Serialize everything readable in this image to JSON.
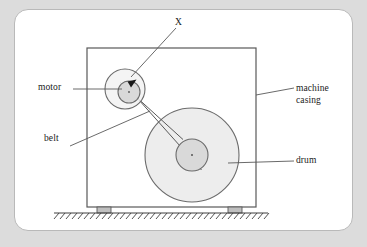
{
  "figure": {
    "labels": {
      "motor": "motor",
      "belt": "belt",
      "point_x": "X",
      "machine_casing_line1": "machine",
      "machine_casing_line2": "casing",
      "drum": "drum"
    },
    "colors": {
      "page_background": "#dcdcdc",
      "panel_background": "#ffffff",
      "panel_border": "#b9b9b9",
      "line": "#595959",
      "part_fill": "#ececec",
      "hub_fill": "#d9d9d9",
      "foot_fill": "#bfbfbf",
      "text": "#1a1a1a"
    },
    "parts": [
      {
        "name": "machine-casing",
        "shape": "rectangle",
        "x": 87,
        "y": 48,
        "width": 169,
        "height": 159
      },
      {
        "name": "motor-housing",
        "shape": "circle",
        "cx": 125,
        "cy": 89,
        "r": 20
      },
      {
        "name": "motor-pulley",
        "shape": "circle",
        "cx": 129,
        "cy": 92,
        "r": 11
      },
      {
        "name": "drum",
        "shape": "circle",
        "cx": 192,
        "cy": 155,
        "r": 47
      },
      {
        "name": "drum-hub",
        "shape": "circle",
        "cx": 192,
        "cy": 155,
        "r": 16
      },
      {
        "name": "belt",
        "shape": "tangent-lines",
        "from": "motor-pulley",
        "to": "drum-hub"
      },
      {
        "name": "foot-left",
        "shape": "rectangle",
        "x": 97,
        "y": 207,
        "width": 14,
        "height": 6
      },
      {
        "name": "foot-right",
        "shape": "rectangle",
        "x": 228,
        "y": 207,
        "width": 14,
        "height": 6
      },
      {
        "name": "ground",
        "shape": "hatched-line",
        "x1": 54,
        "x2": 268,
        "y": 213
      }
    ]
  }
}
